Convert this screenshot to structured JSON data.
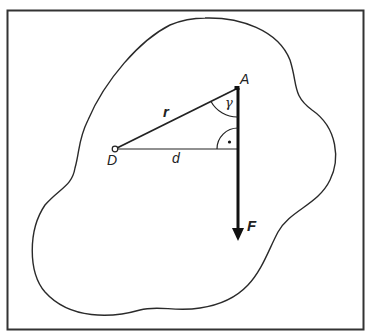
{
  "diagram": {
    "colors": {
      "stroke": "#2a2a2a",
      "frame": "#333333",
      "background": "#ffffff"
    },
    "labels": {
      "point_A": "A",
      "point_D": "D",
      "radius": "r",
      "distance": "d",
      "angle": "γ",
      "force": "F",
      "right_angle_mark": "·"
    },
    "points": {
      "A": [
        238,
        88
      ],
      "D": [
        115,
        149
      ],
      "foot": [
        238,
        149
      ],
      "F_tip": [
        238,
        240
      ]
    }
  }
}
